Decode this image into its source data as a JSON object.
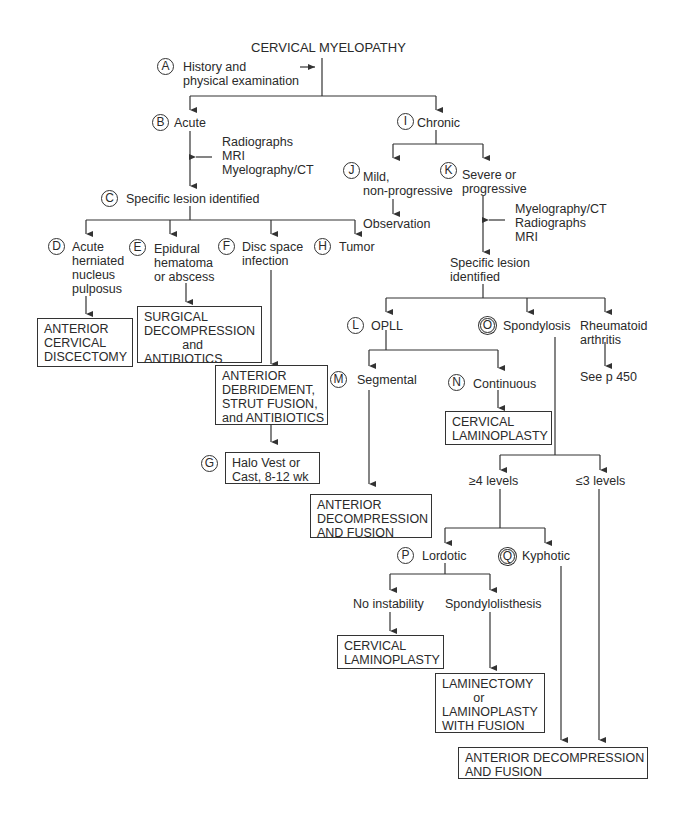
{
  "diagram": {
    "title": "CERVICAL MYELOPATHY",
    "nodes": {
      "A": {
        "letter": "A",
        "label": "History and\nphysical examination"
      },
      "B": {
        "letter": "B",
        "label": "Acute"
      },
      "B_tests": {
        "label": "Radiographs\nMRI\nMyelography/CT"
      },
      "C": {
        "letter": "C",
        "label": "Specific lesion identified"
      },
      "D": {
        "letter": "D",
        "label": "Acute\nherniated\nnucleus\npulposus"
      },
      "D_tx": {
        "label": "ANTERIOR\nCERVICAL\nDISCECTOMY"
      },
      "E": {
        "letter": "E",
        "label": "Epidural\nhematoma\nor abscess"
      },
      "E_tx": {
        "label": "SURGICAL\nDECOMPRESSION\n           and\nANTIBIOTICS"
      },
      "F": {
        "letter": "F",
        "label": "Disc space\ninfection"
      },
      "F_tx": {
        "label": "ANTERIOR\nDEBRIDEMENT,\nSTRUT FUSION,\nand ANTIBIOTICS"
      },
      "G": {
        "letter": "G",
        "label": "Halo Vest or\nCast, 8-12 wk"
      },
      "H": {
        "letter": "H",
        "label": "Tumor"
      },
      "I": {
        "letter": "I",
        "label": "Chronic"
      },
      "J": {
        "letter": "J",
        "label": "Mild,\nnon-progressive"
      },
      "J_tx": {
        "label": "Observation"
      },
      "K": {
        "letter": "K",
        "label": "Severe or\nprogressive"
      },
      "K_tests": {
        "label": "Myelography/CT\nRadiographs\nMRI"
      },
      "K_lesion": {
        "label": "Specific lesion\nidentified"
      },
      "L": {
        "letter": "L",
        "label": "OPLL"
      },
      "M": {
        "letter": "M",
        "label": "Segmental"
      },
      "M_tx": {
        "label": "ANTERIOR\nDECOMPRESSION\nAND FUSION"
      },
      "N": {
        "letter": "N",
        "label": "Continuous"
      },
      "N_tx": {
        "label": "CERVICAL\nLAMINOPLASTY"
      },
      "O": {
        "letter": "O",
        "label": "Spondylosis"
      },
      "RA": {
        "label": "Rheumatoid\narthritis"
      },
      "RA_ref": {
        "label": "See p 450"
      },
      "ge4": {
        "label": "≥4 levels"
      },
      "le3": {
        "label": "≤3 levels"
      },
      "P": {
        "letter": "P",
        "label": "Lordotic"
      },
      "Q": {
        "letter": "Q",
        "label": "Kyphotic"
      },
      "no_instab": {
        "label": "No instability"
      },
      "no_instab_tx": {
        "label": "CERVICAL\nLAMINOPLASTY"
      },
      "spondylolisthesis": {
        "label": "Spondylolisthesis"
      },
      "spondylolisthesis_tx": {
        "label": "LAMINECTOMY\n         or\nLAMINOPLASTY\nWITH FUSION"
      },
      "final_tx": {
        "label": "ANTERIOR DECOMPRESSION\nAND FUSION"
      }
    }
  }
}
